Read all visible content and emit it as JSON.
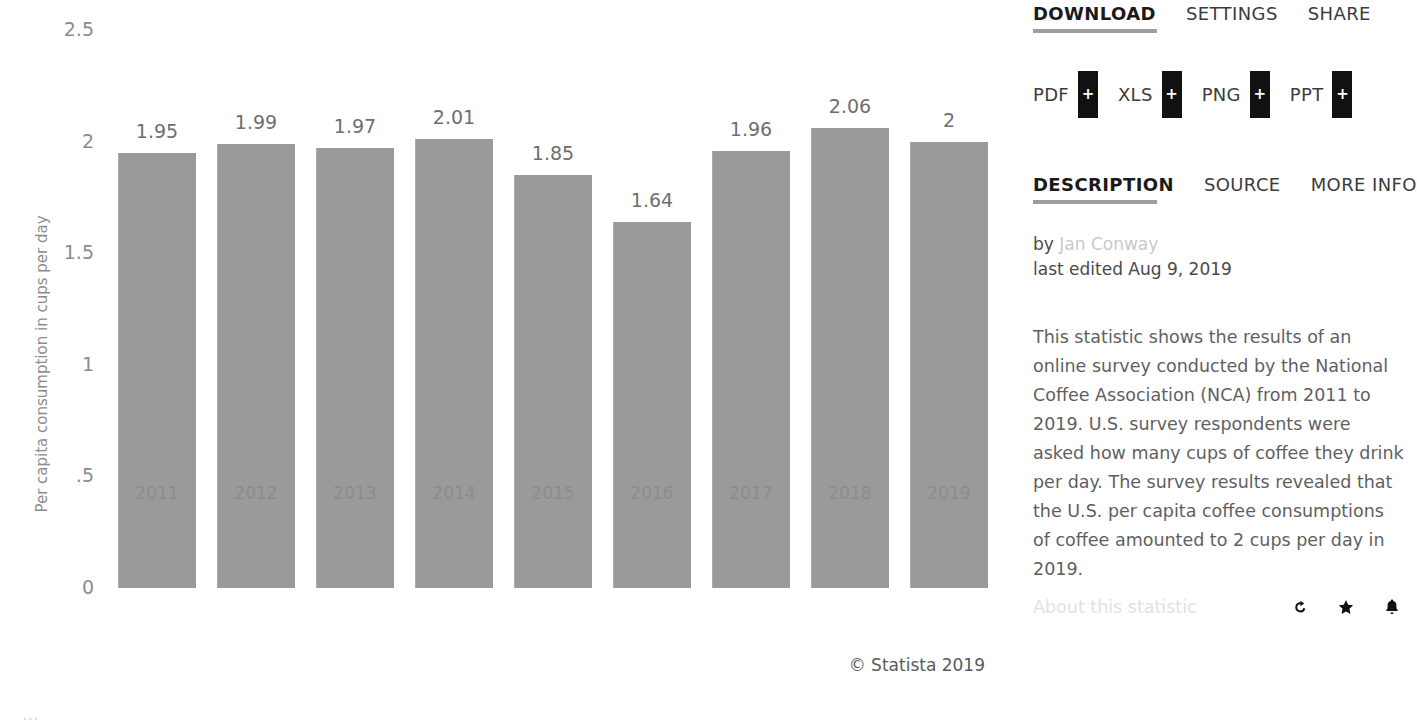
{
  "chart_data": {
    "type": "bar",
    "title": "",
    "xlabel": "",
    "ylabel": "Per capita consumption in cups per day",
    "categories": [
      "2011",
      "2012",
      "2013",
      "2014",
      "2015",
      "2016",
      "2017",
      "2018",
      "2019"
    ],
    "values": [
      1.95,
      1.99,
      1.97,
      2.01,
      1.85,
      1.64,
      1.96,
      2.06,
      2
    ],
    "value_labels": [
      "1.95",
      "1.99",
      "1.97",
      "2.01",
      "1.85",
      "1.64",
      "1.96",
      "2.06",
      "2"
    ],
    "ylim": [
      0,
      2.5
    ],
    "yticks": [
      2.5,
      2,
      1.5,
      1,
      0.5,
      0
    ],
    "ytick_labels": [
      "2.5",
      "2",
      "1.5",
      "1",
      ".5",
      "0"
    ],
    "grid": false,
    "legend": null,
    "bar_color": "#9a9a9a",
    "series": [
      {
        "name": "Per capita consumption in cups per day",
        "values": [
          1.95,
          1.99,
          1.97,
          2.01,
          1.85,
          1.64,
          1.96,
          2.06,
          2
        ]
      }
    ]
  },
  "chart": {
    "copyright": "© Statista 2019",
    "bottom_cut_text": "…"
  },
  "panel": {
    "download": {
      "tabs": [
        {
          "label": "DOWNLOAD",
          "active": true
        },
        {
          "label": "SETTINGS",
          "active": false
        },
        {
          "label": "SHARE",
          "active": false
        }
      ],
      "buttons": [
        {
          "label": "PDF",
          "badge": "+"
        },
        {
          "label": "XLS",
          "badge": "+"
        },
        {
          "label": "PNG",
          "badge": "+"
        },
        {
          "label": "PPT",
          "badge": "+"
        }
      ]
    },
    "info": {
      "tabs": [
        {
          "label": "DESCRIPTION",
          "active": true
        },
        {
          "label": "SOURCE",
          "active": false
        },
        {
          "label": "MORE INFO",
          "active": false
        }
      ],
      "by_prefix": "by ",
      "author": "Jan Conway",
      "last_edited": "last edited Aug 9, 2019",
      "description": "This statistic shows the results of an online survey conducted by the National Coffee Association (NCA) from 2011 to 2019. U.S. survey respondents were asked how many cups of coffee they drink per day. The survey results revealed that the U.S. per capita coffee consumptions of coffee amounted to 2 cups per day in 2019."
    },
    "footer": {
      "about_label": "About this statistic",
      "icons": [
        "history-icon",
        "star-icon",
        "bell-icon"
      ]
    }
  },
  "colors": {
    "bar": "#9a9a9a",
    "tab_underline": "#9d9d9d",
    "badge": "#111111",
    "muted_text": "#8c8c8c"
  }
}
